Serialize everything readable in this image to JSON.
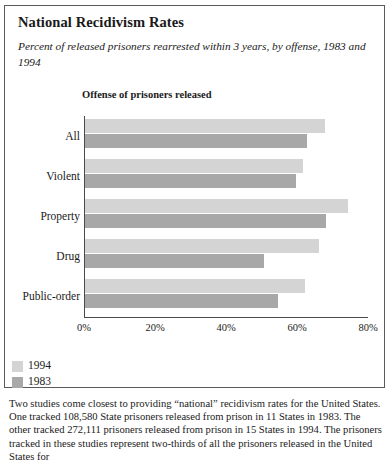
{
  "title": "National Recidivism Rates",
  "subtitle": "Percent of released prisoners rearrested within 3 years, by offense, 1983 and 1994",
  "plot_header": "Offense of prisoners released",
  "legend": {
    "items": [
      {
        "label": "1994",
        "color": "#d4d4d4"
      },
      {
        "label": "1983",
        "color": "#a8a8a8"
      }
    ]
  },
  "footnote": "Two studies come closest to providing “national” recidivism rates for the United States. One tracked 108,580 State prisoners released from prison in 11 States in 1983. The other tracked 272,111 prisoners released from prison in 15 States in 1994. The prisoners tracked in these studies represent two-thirds of all the prisoners released in the United States for",
  "chart_data": {
    "type": "bar",
    "orientation": "horizontal",
    "title": "National Recidivism Rates",
    "subtitle": "Percent of released prisoners rearrested within 3 years, by offense, 1983 and 1994",
    "xlabel": "",
    "ylabel": "Offense of prisoners released",
    "categories": [
      "All",
      "Violent",
      "Property",
      "Drug",
      "Public-order"
    ],
    "series": [
      {
        "name": "1994",
        "color": "#d4d4d4",
        "values": [
          67.5,
          61.5,
          74.0,
          66.0,
          62.0
        ]
      },
      {
        "name": "1983",
        "color": "#a8a8a8",
        "values": [
          62.5,
          59.5,
          68.0,
          50.5,
          54.5
        ]
      }
    ],
    "xlim": [
      0,
      80
    ],
    "xticks": [
      0,
      20,
      40,
      60,
      80
    ],
    "xtick_labels": [
      "0%",
      "20%",
      "40%",
      "60%",
      "80%"
    ],
    "grid": false,
    "legend_position": "below-left"
  }
}
